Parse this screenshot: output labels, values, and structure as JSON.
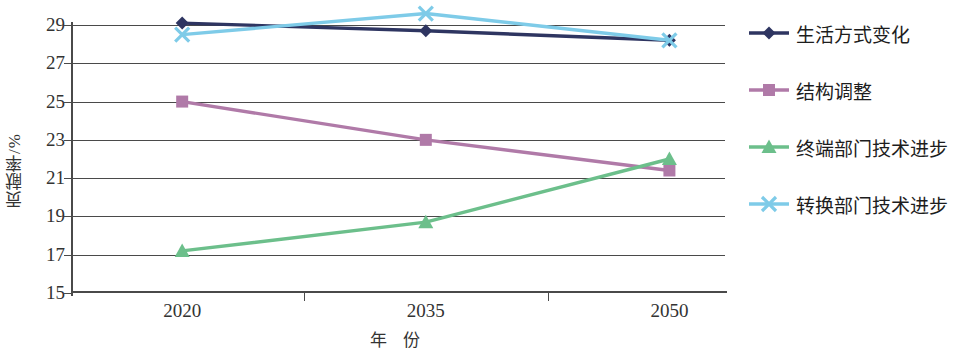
{
  "chart_data": {
    "type": "line",
    "title": "",
    "xlabel": "年  份",
    "ylabel": "贡献率/%",
    "categories": [
      "2020",
      "2035",
      "2050"
    ],
    "x_tick_labels": [
      "2020",
      "2035",
      "2050"
    ],
    "y_tick_labels": [
      "29",
      "27",
      "25",
      "23",
      "21",
      "19",
      "17",
      "15"
    ],
    "ylim": [
      15,
      29
    ],
    "ytick_step": 2,
    "grid": "horizontal",
    "legend_position": "right",
    "series": [
      {
        "name": "生活方式变化",
        "color": "#2e3561",
        "marker": "diamond",
        "values": [
          29.1,
          28.7,
          28.2
        ]
      },
      {
        "name": "结构调整",
        "color": "#b07aa8",
        "marker": "square",
        "values": [
          25.0,
          23.0,
          21.4
        ]
      },
      {
        "name": "终端部门技术进步",
        "color": "#6cbf8b",
        "marker": "triangle",
        "values": [
          17.2,
          18.7,
          22.0
        ]
      },
      {
        "name": "转换部门技术进步",
        "color": "#7ecbe8",
        "marker": "cross",
        "values": [
          28.5,
          29.6,
          28.2
        ]
      }
    ]
  },
  "legend": {
    "items": [
      {
        "label": "生活方式变化",
        "color": "#2e3561",
        "marker": "diamond"
      },
      {
        "label": "结构调整",
        "color": "#b07aa8",
        "marker": "square"
      },
      {
        "label": "终端部门技术进步",
        "color": "#6cbf8b",
        "marker": "triangle"
      },
      {
        "label": "转换部门技术进步",
        "color": "#7ecbe8",
        "marker": "cross"
      }
    ]
  }
}
